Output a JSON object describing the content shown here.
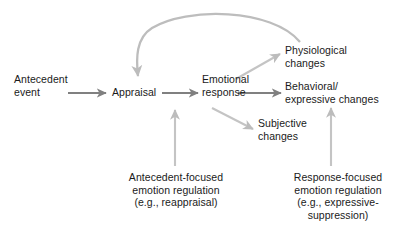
{
  "diagram": {
    "colors": {
      "text": "#1a1a1a",
      "arrow_dark": "#808080",
      "arrow_light": "#bdbdbd",
      "background": "#ffffff"
    },
    "nodes": {
      "antecedent_event": "Antecedent\nevent",
      "appraisal": "Appraisal",
      "emotional_response": "Emotional\nresponse",
      "physiological_changes": "Physiological\nchanges",
      "behavioral_changes": "Behavioral/\nexpressive changes",
      "subjective_changes": "Subjective\nchanges",
      "antecedent_regulation": "Antecedent-focused\nemotion regulation\n(e.g., reappraisal)",
      "response_regulation": "Response-focused\nemotion regulation\n(e.g., expressive-\nsuppression)"
    },
    "arrows": [
      {
        "name": "antecedent-event-to-appraisal",
        "from": "antecedent_event",
        "to": "appraisal",
        "style": "straight-dark"
      },
      {
        "name": "appraisal-to-emotional-response",
        "from": "appraisal",
        "to": "emotional_response",
        "style": "straight-dark"
      },
      {
        "name": "emotional-response-to-physiological",
        "from": "emotional_response",
        "to": "physiological_changes",
        "style": "diagonal-light-up"
      },
      {
        "name": "emotional-response-to-behavioral",
        "from": "emotional_response",
        "to": "behavioral_changes",
        "style": "straight-dark"
      },
      {
        "name": "emotional-response-to-subjective",
        "from": "emotional_response",
        "to": "subjective_changes",
        "style": "diagonal-light-down"
      },
      {
        "name": "feedback-loop-to-appraisal",
        "from": "physiological_changes",
        "to": "appraisal",
        "style": "curved-light"
      },
      {
        "name": "antecedent-regulation-to-appraisal",
        "from": "antecedent_regulation",
        "to": "appraisal",
        "style": "vertical-light-up"
      },
      {
        "name": "response-regulation-to-responses",
        "from": "response_regulation",
        "to": "subjective_changes",
        "style": "vertical-light-up"
      }
    ]
  }
}
